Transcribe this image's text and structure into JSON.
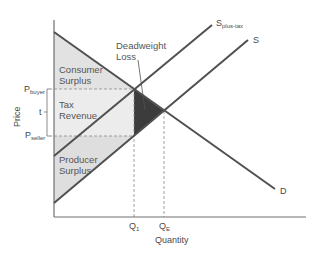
{
  "diagram": {
    "title": "",
    "x_axis_label": "Quantity",
    "y_axis_label": "Price",
    "curves": {
      "demand": {
        "label": "D"
      },
      "supply": {
        "label": "S"
      },
      "supply_plus_tax": {
        "label_main": "S",
        "label_sub": "plus-tax"
      }
    },
    "price_ticks": {
      "p_buyer": {
        "main": "P",
        "sub": "buyer"
      },
      "tax": "t",
      "p_seller": {
        "main": "P",
        "sub": "seller"
      }
    },
    "quantity_ticks": {
      "q1": {
        "main": "Q",
        "sub": "1"
      },
      "qe": {
        "main": "Q",
        "sub": "E"
      }
    },
    "regions": {
      "consumer_surplus": {
        "line1": "Consumer",
        "line2": "Surplus"
      },
      "tax_revenue": {
        "line1": "Tax",
        "line2": "Revenue"
      },
      "producer_surplus": {
        "line1": "Producer",
        "line2": "Surplus"
      },
      "deadweight_loss": {
        "line1": "Deadweight",
        "line2": "Loss"
      }
    },
    "colors": {
      "curve": "#505050",
      "surplus_fill": "#e2e2e2",
      "deadweight_fill": "#3c3c3c",
      "axis": "#707070",
      "dashed": "#8a8a8a"
    }
  }
}
